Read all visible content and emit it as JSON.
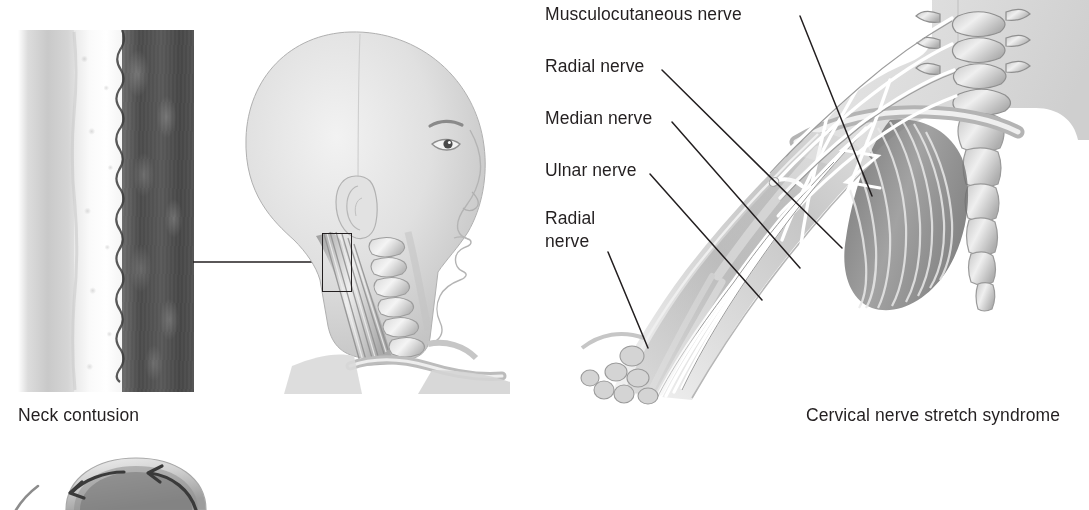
{
  "figure": {
    "background_color": "#ffffff",
    "ink_color": "#231f20",
    "style": "grayscale medical illustration"
  },
  "panels": [
    {
      "id": "neck-contusion",
      "caption": "Neck contusion",
      "caption_x": 18,
      "caption_y": 404,
      "inset": {
        "name": "tissue-cross-section",
        "layers": [
          "skin",
          "subcutaneous fat / hematoma",
          "cervical musculature"
        ]
      }
    },
    {
      "id": "cervical-nerve-stretch",
      "caption": "Cervical nerve stretch syndrome",
      "caption_x": 806,
      "caption_y": 404
    },
    {
      "id": "helmet-rotation",
      "caption": "",
      "note": "partial figure, cropped at bottom edge"
    }
  ],
  "labels": [
    {
      "id": "musculocutaneous-nerve",
      "text": "Musculocutaneous nerve",
      "x": 545,
      "y": 4,
      "leader_to": [
        866,
        196
      ]
    },
    {
      "id": "radial-nerve-upper",
      "text": "Radial nerve",
      "x": 545,
      "y": 56,
      "leader_to": [
        800,
        222
      ]
    },
    {
      "id": "median-nerve",
      "text": "Median nerve",
      "x": 545,
      "y": 108,
      "leader_to": [
        752,
        268
      ]
    },
    {
      "id": "ulnar-nerve",
      "text": "Ulnar nerve",
      "x": 545,
      "y": 160,
      "leader_to": [
        712,
        296
      ]
    },
    {
      "id": "radial-nerve-lower",
      "text": "Radial\nnerve",
      "x": 545,
      "y": 208,
      "leader_to": [
        648,
        344
      ]
    }
  ],
  "callout": {
    "name": "neck-magnification-box",
    "x": 322,
    "y": 233,
    "width": 28,
    "height": 57,
    "leader_to": [
      194,
      262
    ]
  },
  "anatomy_terms": [
    "cervical vertebrae",
    "sternum",
    "clavicle",
    "ribs",
    "brachial plexus",
    "trapezius",
    "sternocleidomastoid",
    "humerus",
    "radius",
    "ulna",
    "carpal bones"
  ],
  "arrows": {
    "name": "helmet-rotation-arrows",
    "count": 2,
    "direction": "inward / rotational"
  }
}
